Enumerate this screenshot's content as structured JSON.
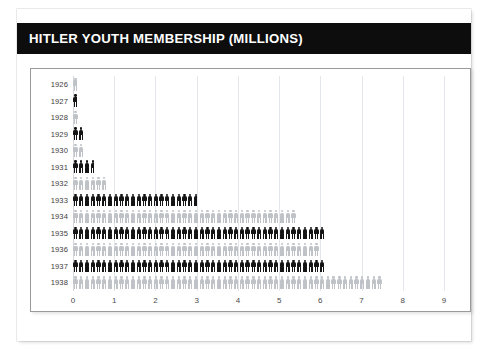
{
  "header": {
    "title": "HITLER YOUTH MEMBERSHIP (MILLIONS)",
    "background_color": "#0d0d0d",
    "text_color": "#ffffff"
  },
  "chart_data": {
    "type": "bar",
    "subtype": "pictogram",
    "title": "HITLER YOUTH MEMBERSHIP (MILLIONS)",
    "xlabel": "",
    "ylabel": "",
    "orientation": "horizontal",
    "xlim": [
      0,
      9
    ],
    "grid": true,
    "legend": null,
    "unit_per_icon": 0.1,
    "icon": "person-pictogram",
    "colors": {
      "dark": "#141414",
      "light": "#bfc3c7",
      "gridline": "#e3e6ea",
      "frame": "#9a9a9a",
      "page_background": "#ffffff",
      "card_background": "#ffffff"
    },
    "categories": [
      "1926",
      "1927",
      "1928",
      "1929",
      "1930",
      "1931",
      "1932",
      "1933",
      "1934",
      "1935",
      "1936",
      "1937",
      "1938"
    ],
    "values": [
      0.1,
      0.1,
      0.2,
      0.3,
      0.3,
      0.5,
      0.9,
      3.0,
      5.5,
      6.1,
      6.05,
      6.2,
      7.6
    ],
    "xticks": [
      "0",
      "1",
      "2",
      "3",
      "4",
      "5",
      "6",
      "7",
      "8",
      "9"
    ],
    "bars": [
      {
        "year": "1926",
        "value": 0.1,
        "shade": "light"
      },
      {
        "year": "1927",
        "value": 0.1,
        "shade": "dark"
      },
      {
        "year": "1928",
        "value": 0.2,
        "shade": "light"
      },
      {
        "year": "1929",
        "value": 0.3,
        "shade": "dark"
      },
      {
        "year": "1930",
        "value": 0.3,
        "shade": "light"
      },
      {
        "year": "1931",
        "value": 0.5,
        "shade": "dark"
      },
      {
        "year": "1932",
        "value": 0.9,
        "shade": "light"
      },
      {
        "year": "1933",
        "value": 3.0,
        "shade": "dark"
      },
      {
        "year": "1934",
        "value": 5.5,
        "shade": "light"
      },
      {
        "year": "1935",
        "value": 6.1,
        "shade": "dark"
      },
      {
        "year": "1936",
        "value": 6.05,
        "shade": "light"
      },
      {
        "year": "1937",
        "value": 6.2,
        "shade": "dark"
      },
      {
        "year": "1938",
        "value": 7.6,
        "shade": "light"
      }
    ]
  }
}
